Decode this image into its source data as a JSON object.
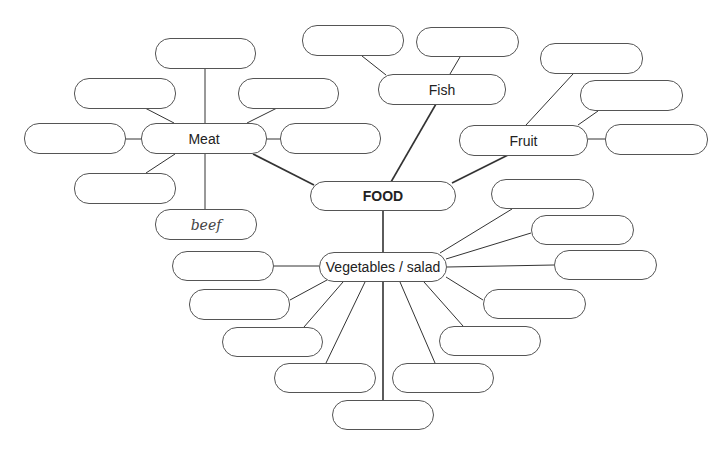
{
  "diagram": {
    "title": "FOOD",
    "categories": [
      "Meat",
      "Fish",
      "Fruit",
      "Vegetables / salad"
    ],
    "nodes": [
      {
        "id": "food",
        "label": "FOOD",
        "x": 310,
        "y": 181,
        "w": 146,
        "h": 30,
        "kind": "center"
      },
      {
        "id": "meat",
        "label": "Meat",
        "x": 141,
        "y": 123,
        "w": 126,
        "h": 31,
        "kind": "category"
      },
      {
        "id": "fish",
        "label": "Fish",
        "x": 378,
        "y": 74,
        "w": 128,
        "h": 31,
        "kind": "category"
      },
      {
        "id": "fruit",
        "label": "Fruit",
        "x": 459,
        "y": 125,
        "w": 129,
        "h": 31,
        "kind": "category"
      },
      {
        "id": "veg",
        "label": "Vegetables / salad",
        "x": 319,
        "y": 252,
        "w": 128,
        "h": 30,
        "kind": "category"
      },
      {
        "id": "m1",
        "label": "",
        "x": 155,
        "y": 38,
        "w": 101,
        "h": 31
      },
      {
        "id": "m2",
        "label": "",
        "x": 74,
        "y": 78,
        "w": 102,
        "h": 31
      },
      {
        "id": "m3",
        "label": "",
        "x": 238,
        "y": 78,
        "w": 101,
        "h": 31
      },
      {
        "id": "m4",
        "label": "",
        "x": 24,
        "y": 123,
        "w": 102,
        "h": 31
      },
      {
        "id": "m5",
        "label": "",
        "x": 280,
        "y": 123,
        "w": 101,
        "h": 31
      },
      {
        "id": "m6",
        "label": "",
        "x": 74,
        "y": 173,
        "w": 102,
        "h": 31
      },
      {
        "id": "m7",
        "label": "beef",
        "x": 155,
        "y": 209,
        "w": 102,
        "h": 31,
        "kind": "hand"
      },
      {
        "id": "f1",
        "label": "",
        "x": 302,
        "y": 25,
        "w": 102,
        "h": 31
      },
      {
        "id": "f2",
        "label": "",
        "x": 416,
        "y": 27,
        "w": 103,
        "h": 30
      },
      {
        "id": "r1",
        "label": "",
        "x": 540,
        "y": 43,
        "w": 103,
        "h": 31
      },
      {
        "id": "r2",
        "label": "",
        "x": 580,
        "y": 80,
        "w": 103,
        "h": 31
      },
      {
        "id": "r3",
        "label": "",
        "x": 605,
        "y": 124,
        "w": 103,
        "h": 31
      },
      {
        "id": "v1",
        "label": "",
        "x": 491,
        "y": 179,
        "w": 103,
        "h": 30
      },
      {
        "id": "v2",
        "label": "",
        "x": 531,
        "y": 215,
        "w": 103,
        "h": 30
      },
      {
        "id": "v3",
        "label": "",
        "x": 554,
        "y": 250,
        "w": 103,
        "h": 30
      },
      {
        "id": "v4",
        "label": "",
        "x": 483,
        "y": 289,
        "w": 103,
        "h": 30
      },
      {
        "id": "v5",
        "label": "",
        "x": 439,
        "y": 326,
        "w": 102,
        "h": 30
      },
      {
        "id": "v6",
        "label": "",
        "x": 392,
        "y": 363,
        "w": 102,
        "h": 30
      },
      {
        "id": "v7",
        "label": "",
        "x": 332,
        "y": 400,
        "w": 102,
        "h": 30
      },
      {
        "id": "v8",
        "label": "",
        "x": 274,
        "y": 363,
        "w": 102,
        "h": 30
      },
      {
        "id": "v9",
        "label": "",
        "x": 222,
        "y": 327,
        "w": 101,
        "h": 30
      },
      {
        "id": "v10",
        "label": "",
        "x": 189,
        "y": 289,
        "w": 101,
        "h": 31
      },
      {
        "id": "v11",
        "label": "",
        "x": 172,
        "y": 251,
        "w": 102,
        "h": 30
      }
    ],
    "edges": [
      {
        "x1": 253,
        "y1": 154,
        "x2": 314,
        "y2": 185,
        "w": 1.6
      },
      {
        "x1": 436,
        "y1": 104,
        "x2": 391,
        "y2": 182,
        "w": 1.6
      },
      {
        "x1": 508,
        "y1": 155,
        "x2": 452,
        "y2": 183,
        "w": 1.6
      },
      {
        "x1": 383,
        "y1": 211,
        "x2": 383,
        "y2": 252,
        "w": 1.6
      },
      {
        "x1": 205,
        "y1": 69,
        "x2": 205,
        "y2": 123,
        "w": 1
      },
      {
        "x1": 145,
        "y1": 108,
        "x2": 174,
        "y2": 123,
        "w": 1
      },
      {
        "x1": 277,
        "y1": 108,
        "x2": 247,
        "y2": 123,
        "w": 1
      },
      {
        "x1": 126,
        "y1": 139,
        "x2": 141,
        "y2": 139,
        "w": 1
      },
      {
        "x1": 267,
        "y1": 139,
        "x2": 280,
        "y2": 139,
        "w": 1
      },
      {
        "x1": 146,
        "y1": 173,
        "x2": 175,
        "y2": 154,
        "w": 1
      },
      {
        "x1": 205,
        "y1": 154,
        "x2": 205,
        "y2": 209,
        "w": 1
      },
      {
        "x1": 362,
        "y1": 56,
        "x2": 386,
        "y2": 75,
        "w": 1
      },
      {
        "x1": 460,
        "y1": 57,
        "x2": 450,
        "y2": 74,
        "w": 1
      },
      {
        "x1": 573,
        "y1": 74,
        "x2": 526,
        "y2": 125,
        "w": 1
      },
      {
        "x1": 598,
        "y1": 111,
        "x2": 578,
        "y2": 125,
        "w": 1
      },
      {
        "x1": 588,
        "y1": 139,
        "x2": 605,
        "y2": 139,
        "w": 1
      },
      {
        "x1": 512,
        "y1": 209,
        "x2": 440,
        "y2": 253,
        "w": 1
      },
      {
        "x1": 531,
        "y1": 233,
        "x2": 446,
        "y2": 259,
        "w": 1
      },
      {
        "x1": 554,
        "y1": 265,
        "x2": 447,
        "y2": 267,
        "w": 1
      },
      {
        "x1": 483,
        "y1": 300,
        "x2": 446,
        "y2": 277,
        "w": 1
      },
      {
        "x1": 463,
        "y1": 326,
        "x2": 424,
        "y2": 282,
        "w": 1
      },
      {
        "x1": 435,
        "y1": 363,
        "x2": 400,
        "y2": 282,
        "w": 1
      },
      {
        "x1": 383,
        "y1": 282,
        "x2": 383,
        "y2": 400,
        "w": 1.6
      },
      {
        "x1": 326,
        "y1": 363,
        "x2": 365,
        "y2": 282,
        "w": 1
      },
      {
        "x1": 304,
        "y1": 327,
        "x2": 343,
        "y2": 282,
        "w": 1
      },
      {
        "x1": 290,
        "y1": 300,
        "x2": 327,
        "y2": 280,
        "w": 1
      },
      {
        "x1": 274,
        "y1": 266,
        "x2": 319,
        "y2": 266,
        "w": 1
      }
    ]
  },
  "colors": {
    "line": "#333333",
    "border": "#555555",
    "background": "#ffffff"
  }
}
